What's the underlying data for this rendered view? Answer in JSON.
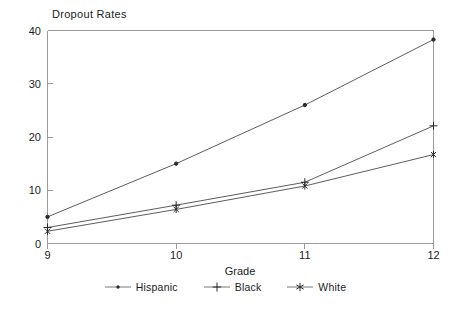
{
  "chart_data": {
    "type": "line",
    "title": "Dropout Rates",
    "xlabel": "Grade",
    "ylabel": "",
    "x": [
      9,
      10,
      11,
      12
    ],
    "categories": [
      "9",
      "10",
      "11",
      "12"
    ],
    "xlim": [
      9,
      12
    ],
    "ylim": [
      0,
      40
    ],
    "yticks": [
      0,
      10,
      20,
      30,
      40
    ],
    "ytick_labels": [
      "0",
      "10",
      "20",
      "30",
      "40"
    ],
    "xticks": [
      9,
      10,
      11,
      12
    ],
    "xtick_labels": [
      "9",
      "10",
      "11",
      "12"
    ],
    "grid": false,
    "legend_position": "bottom",
    "series": [
      {
        "name": "Hispanic",
        "marker": "dot",
        "color": "#2a2a2a",
        "values": [
          5.0,
          15.0,
          26.0,
          38.3
        ]
      },
      {
        "name": "Black",
        "marker": "plus",
        "color": "#2a2a2a",
        "values": [
          3.0,
          7.2,
          11.5,
          22.1
        ]
      },
      {
        "name": "White",
        "marker": "asterisk",
        "color": "#2a2a2a",
        "values": [
          2.3,
          6.4,
          10.8,
          16.7
        ]
      }
    ]
  },
  "legend": {
    "items": [
      {
        "label": "Hispanic"
      },
      {
        "label": "Black"
      },
      {
        "label": "White"
      }
    ]
  },
  "axes": {
    "x_title": "Grade",
    "y_tick_0": "0",
    "y_tick_1": "10",
    "y_tick_2": "20",
    "y_tick_3": "30",
    "y_tick_4": "40",
    "x_tick_0": "9",
    "x_tick_1": "10",
    "x_tick_2": "11",
    "x_tick_3": "12"
  }
}
